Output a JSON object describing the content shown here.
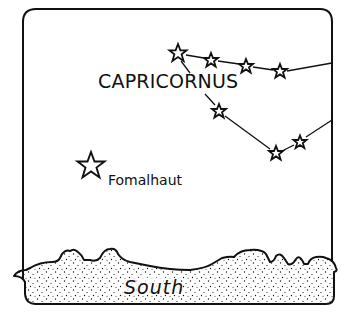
{
  "diagram": {
    "type": "star-chart",
    "constellation": {
      "name": "CAPRICORNUS",
      "stars": [
        {
          "x": 178,
          "y": 53,
          "r": 8
        },
        {
          "x": 211,
          "y": 60,
          "r": 6.5
        },
        {
          "x": 246,
          "y": 66,
          "r": 6.5
        },
        {
          "x": 280,
          "y": 71,
          "r": 6.5
        },
        {
          "x": 219,
          "y": 111,
          "r": 6.5
        },
        {
          "x": 276,
          "y": 153,
          "r": 6.5
        },
        {
          "x": 300,
          "y": 142,
          "r": 6
        }
      ]
    },
    "bright_star": {
      "name": "Fomalhaut",
      "x": 91,
      "y": 166,
      "r": 14
    },
    "horizon": {
      "label": "South"
    }
  }
}
